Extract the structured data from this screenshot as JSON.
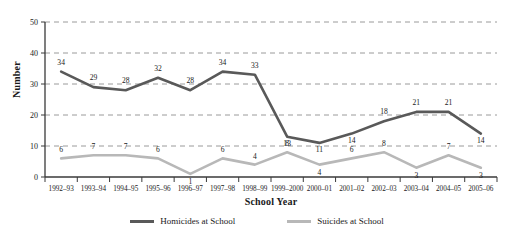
{
  "chart_data": {
    "type": "line",
    "title": "",
    "xlabel": "School Year",
    "ylabel": "Number",
    "ylim": [
      0,
      50
    ],
    "yticks": [
      0,
      10,
      20,
      30,
      40,
      50
    ],
    "grid": "horizontal-dashed",
    "legend_position": "bottom-center",
    "categories": [
      "1992–93",
      "1993–94",
      "1994–95",
      "1995–96",
      "1996–97",
      "1997–98",
      "1998–99",
      "1999–2000",
      "2000–01",
      "2001–02",
      "2002–03",
      "2003–04",
      "2004–05",
      "2005–06"
    ],
    "series": [
      {
        "name": "Homicides at School",
        "color": "#595959",
        "values": [
          34,
          29,
          28,
          32,
          28,
          34,
          33,
          13,
          11,
          14,
          18,
          21,
          21,
          14
        ],
        "label_offsets_y": [
          -7,
          -7,
          -7,
          -7,
          -7,
          -7,
          -7,
          9,
          9,
          9,
          -7,
          -7,
          -7,
          9
        ]
      },
      {
        "name": "Suicides at School",
        "color": "#b8b8b8",
        "values": [
          6,
          7,
          7,
          6,
          1,
          6,
          4,
          8,
          4,
          6,
          8,
          3,
          7,
          3
        ],
        "label_offsets_y": [
          -6,
          -6,
          -6,
          -6,
          10,
          -6,
          -6,
          -6,
          10,
          -6,
          -6,
          10,
          -6,
          10
        ]
      }
    ]
  },
  "axis": {
    "y_label": "Number",
    "x_label": "School Year"
  },
  "legend": {
    "items": [
      {
        "label": "Homicides at School",
        "color": "#595959"
      },
      {
        "label": "Suicides at School",
        "color": "#b8b8b8"
      }
    ]
  },
  "colors": {
    "homicides": "#595959",
    "suicides": "#b8b8b8",
    "gridline": "#9a9a9a",
    "axis": "#3a3a3a",
    "text": "#1a1a1a"
  }
}
